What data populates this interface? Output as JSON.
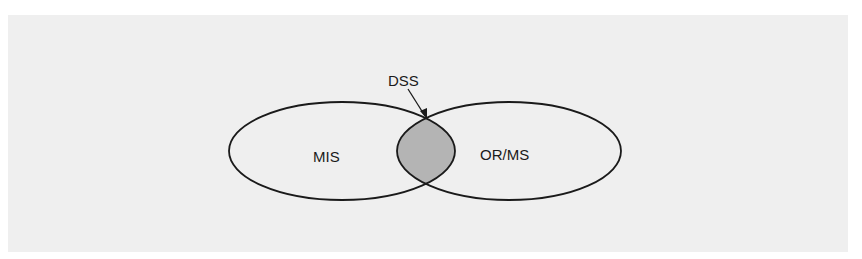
{
  "diagram": {
    "type": "venn",
    "sets": [
      {
        "label": "MIS"
      },
      {
        "label": "OR/MS"
      }
    ],
    "intersection": {
      "label": "DSS"
    },
    "colors": {
      "background": "#ffffff",
      "panel": "#efefef",
      "stroke": "#1a1a1a",
      "intersection_fill": "#b4b4b4"
    }
  }
}
